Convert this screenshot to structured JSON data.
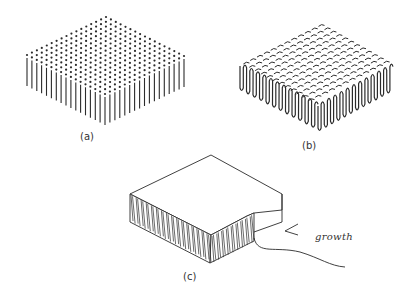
{
  "figure": {
    "panels": [
      {
        "id": "a",
        "label": "(a)",
        "description": "Array of vertical pillars with dotted tops forming an isometric slab"
      },
      {
        "id": "b",
        "label": "(b)",
        "description": "Slab of wavy/folded walls seen isometrically with dashed top"
      },
      {
        "id": "c",
        "label": "(c)",
        "description": "Solid block with corrugated edge and a notch; arrow labeled growth"
      }
    ],
    "annotation": "growth",
    "colors": {
      "ink": "#2b2b2b",
      "background": "#ffffff"
    }
  }
}
